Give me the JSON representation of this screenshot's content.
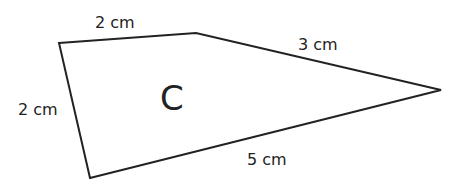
{
  "shape": {
    "name": "C",
    "type": "quadrilateral",
    "stroke": "#222222",
    "vertices": [
      [
        59,
        43
      ],
      [
        196,
        33
      ],
      [
        441,
        90
      ],
      [
        90,
        178
      ]
    ]
  },
  "labels": {
    "top": "2 cm",
    "upper_right": "3 cm",
    "left": "2 cm",
    "bottom": "5 cm",
    "shape_label": "C"
  }
}
